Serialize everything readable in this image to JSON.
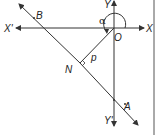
{
  "diagram": {
    "type": "geometry-normal-form-line",
    "colors": {
      "line": "#333333",
      "background": "#ffffff"
    },
    "axes": {
      "x_positive_label": "X",
      "x_negative_label": "X'",
      "y_positive_label": "Y",
      "y_negative_label": "Y'",
      "origin_label": "O"
    },
    "line": {
      "point_a_label": "A",
      "point_b_label": "B"
    },
    "perpendicular": {
      "foot_label": "N",
      "length_label": "p"
    },
    "angle": {
      "label": "α"
    }
  }
}
